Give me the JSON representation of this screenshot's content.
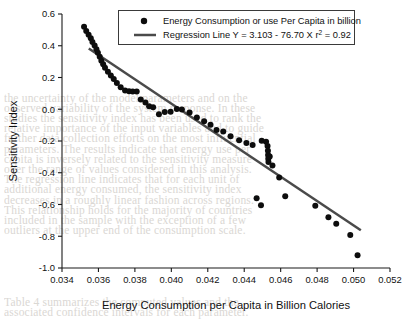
{
  "chart_data": {
    "type": "scatter",
    "title": "",
    "xlabel": "Energy Consumption per Capita in Billion Calories",
    "ylabel": "Sensitivity Index",
    "xlim": [
      0.034,
      0.052
    ],
    "ylim": [
      -1.0,
      0.6
    ],
    "xticks": [
      "0.034",
      "0.036",
      "0.038",
      "0.040",
      "0.042",
      "0.044",
      "0.046",
      "0.048",
      "0.050",
      "0.052"
    ],
    "xtick_values": [
      0.034,
      0.036,
      0.038,
      0.04,
      0.042,
      0.044,
      0.046,
      0.048,
      0.05,
      0.052
    ],
    "yticks": [
      "0.6",
      "0.4",
      "0.2",
      "0.0",
      "-0.2",
      "-0.4",
      "-0.6",
      "-0.8",
      "-1.0"
    ],
    "ytick_values": [
      0.6,
      0.4,
      0.2,
      0.0,
      -0.2,
      -0.4,
      -0.6,
      -0.8,
      -1.0
    ],
    "grid": false,
    "legend_position": "top-center",
    "legend": [
      {
        "marker": "circle",
        "label": "Energy Consumption or use Per Capita in billion"
      },
      {
        "marker": "line",
        "label": "Regression Line Y = 3.103 - 76.70 X r2 = 0.92"
      }
    ],
    "series": [
      {
        "name": "Energy Consumption or use Per Capita in billion",
        "marker": "circle",
        "color": "#0d0d0d",
        "points": [
          [
            0.03521,
            0.52
          ],
          [
            0.03533,
            0.493
          ],
          [
            0.03546,
            0.47
          ],
          [
            0.03558,
            0.447
          ],
          [
            0.03567,
            0.424
          ],
          [
            0.03579,
            0.402
          ],
          [
            0.03589,
            0.378
          ],
          [
            0.03597,
            0.356
          ],
          [
            0.03607,
            0.33
          ],
          [
            0.03616,
            0.305
          ],
          [
            0.03626,
            0.283
          ],
          [
            0.03636,
            0.262
          ],
          [
            0.03652,
            0.236
          ],
          [
            0.03668,
            0.212
          ],
          [
            0.03684,
            0.19
          ],
          [
            0.03701,
            0.165
          ],
          [
            0.03722,
            0.139
          ],
          [
            0.03746,
            0.118
          ],
          [
            0.03768,
            0.113
          ],
          [
            0.03788,
            0.112
          ],
          [
            0.0381,
            0.112
          ],
          [
            0.03832,
            0.062
          ],
          [
            0.03858,
            0.042
          ],
          [
            0.03878,
            0.019
          ],
          [
            0.039,
            0.012
          ],
          [
            0.03932,
            -0.032
          ],
          [
            0.03964,
            -0.018
          ],
          [
            0.03996,
            -0.015
          ],
          [
            0.0403,
            0.001
          ],
          [
            0.04058,
            -0.002
          ],
          [
            0.041,
            -0.02
          ],
          [
            0.0414,
            -0.052
          ],
          [
            0.0418,
            -0.075
          ],
          [
            0.04215,
            -0.098
          ],
          [
            0.04248,
            -0.13
          ],
          [
            0.04285,
            -0.14
          ],
          [
            0.04325,
            -0.17
          ],
          [
            0.04372,
            -0.196
          ],
          [
            0.04412,
            -0.213
          ],
          [
            0.04446,
            -0.225
          ],
          [
            0.04496,
            -0.198
          ],
          [
            0.0452,
            -0.205
          ],
          [
            0.04528,
            -0.232
          ],
          [
            0.0453,
            -0.262
          ],
          [
            0.04531,
            -0.288
          ],
          [
            0.04532,
            -0.312
          ],
          [
            0.04533,
            -0.332
          ],
          [
            0.0454,
            -0.298
          ],
          [
            0.04555,
            -0.355
          ],
          [
            0.04592,
            -0.43
          ],
          [
            0.04468,
            -0.56
          ],
          [
            0.04492,
            -0.604
          ],
          [
            0.04625,
            -0.548
          ],
          [
            0.0479,
            -0.608
          ],
          [
            0.04862,
            -0.68
          ],
          [
            0.04905,
            -0.722
          ],
          [
            0.04982,
            -0.792
          ],
          [
            0.05022,
            -0.92
          ]
        ]
      }
    ],
    "regression": {
      "label": "Regression Line Y = 3.103 - 76.70 X r2 = 0.92",
      "intercept": 3.103,
      "slope": -76.7,
      "r_squared": 0.92,
      "color": "#4a4a4a",
      "x_start": 0.03547,
      "x_end": 0.0504
    }
  },
  "background_text": {
    "lines": [
      "",
      "",
      "",
      "",
      "",
      "",
      "",
      "",
      "the uncertainty of the model parameters and on the",
      "observed variability of the system response. In these",
      "studies the sensitivity index has been used to rank the",
      "relative importance of the input variables and to guide",
      "further data collection efforts on the most influential",
      "parameters. The results indicate that energy use per",
      "capita is inversely related to the sensitivity measure",
      "over the range of values considered in this analysis.",
      "The regression line indicates that for each unit of",
      "additional energy consumed, the sensitivity index",
      "decreases in a roughly linear fashion across regions.",
      "This relationship holds for the majority of countries",
      "included in the sample with the exception of a few",
      "outliers at the upper end of the consumption scale.",
      "",
      "",
      "",
      "",
      "",
      "",
      "Table 4 summarizes the computed values and the",
      "associated confidence intervals for each parameter."
    ]
  }
}
